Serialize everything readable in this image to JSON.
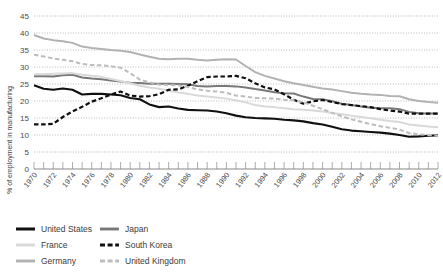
{
  "chart_data": {
    "type": "line",
    "title": "",
    "subtitle": "",
    "xlabel": "",
    "ylabel": "% of employment in manufacturing",
    "xlim": [
      1970,
      2012
    ],
    "ylim": [
      0,
      45
    ],
    "ytick_values": [
      0,
      5,
      10,
      15,
      20,
      25,
      30,
      35,
      40,
      45
    ],
    "ytick_labels": [
      "0",
      "5",
      "10",
      "15",
      "20",
      "25",
      "30",
      "35",
      "40",
      "45"
    ],
    "xtick_labels": [
      "1970",
      "1972",
      "1974",
      "1976",
      "1978",
      "1980",
      "1982",
      "1984",
      "1986",
      "1988",
      "1990",
      "1992",
      "1994",
      "1996",
      "1998",
      "2000",
      "2002",
      "2004",
      "2006",
      "2008",
      "2010",
      "2012"
    ],
    "x_minor_step": 1,
    "grid": "horizontal-dotted",
    "legend_position": "below-plot",
    "x": [
      1970,
      1971,
      1972,
      1973,
      1974,
      1975,
      1976,
      1977,
      1978,
      1979,
      1980,
      1981,
      1982,
      1983,
      1984,
      1985,
      1986,
      1987,
      1988,
      1989,
      1990,
      1991,
      1992,
      1993,
      1994,
      1995,
      1996,
      1997,
      1998,
      1999,
      2000,
      2001,
      2002,
      2003,
      2004,
      2005,
      2006,
      2007,
      2008,
      2009,
      2010,
      2011,
      2012
    ],
    "series": [
      {
        "name": "United States",
        "color": "#101010",
        "style": "solid",
        "width": 2.1,
        "values": [
          24.6,
          23.6,
          23.3,
          23.7,
          23.3,
          21.9,
          22.1,
          22.1,
          21.9,
          21.7,
          20.9,
          20.5,
          19.0,
          18.2,
          18.4,
          17.8,
          17.4,
          17.3,
          17.2,
          16.9,
          16.4,
          15.7,
          15.2,
          15.0,
          14.9,
          14.8,
          14.5,
          14.3,
          14.0,
          13.5,
          13.1,
          12.4,
          11.7,
          11.3,
          11.1,
          10.9,
          10.7,
          10.4,
          10.0,
          9.5,
          9.6,
          9.8,
          9.9
        ]
      },
      {
        "name": "Japan",
        "color": "#787878",
        "style": "solid",
        "width": 2.0,
        "values": [
          27.3,
          27.3,
          27.2,
          27.6,
          27.7,
          26.9,
          26.6,
          26.4,
          26.0,
          25.7,
          25.4,
          25.3,
          25.1,
          25.1,
          25.1,
          25.0,
          24.9,
          24.4,
          24.3,
          24.4,
          24.4,
          24.3,
          24.0,
          23.5,
          23.1,
          22.6,
          22.3,
          22.2,
          21.3,
          20.6,
          20.5,
          19.9,
          19.2,
          18.8,
          18.4,
          18.0,
          17.9,
          17.9,
          17.6,
          16.8,
          16.4,
          16.3,
          16.3
        ]
      },
      {
        "name": "France",
        "color": "#d9d9d9",
        "style": "solid",
        "width": 2.0,
        "values": [
          27.9,
          27.9,
          28.0,
          28.1,
          28.2,
          27.7,
          27.4,
          27.1,
          26.5,
          25.9,
          25.2,
          24.5,
          24.0,
          23.6,
          23.1,
          22.5,
          22.1,
          21.6,
          21.3,
          21.0,
          20.7,
          20.2,
          19.6,
          18.8,
          18.4,
          18.2,
          17.9,
          17.6,
          17.4,
          17.2,
          16.9,
          16.5,
          16.1,
          15.7,
          15.3,
          14.9,
          14.5,
          14.1,
          13.8,
          13.1,
          12.8,
          12.5,
          12.3
        ]
      },
      {
        "name": "South Korea",
        "color": "#101010",
        "style": "dashed",
        "width": 2.2,
        "values": [
          13.1,
          13.1,
          13.3,
          15.3,
          16.9,
          18.3,
          19.8,
          20.8,
          21.9,
          22.8,
          21.6,
          21.3,
          21.4,
          22.0,
          23.3,
          23.4,
          24.5,
          25.8,
          27.0,
          27.2,
          27.2,
          27.4,
          26.7,
          25.2,
          24.0,
          23.4,
          22.0,
          20.4,
          19.2,
          19.9,
          20.3,
          19.7,
          19.1,
          18.8,
          18.5,
          18.2,
          17.6,
          17.2,
          16.9,
          16.3,
          16.3,
          16.3,
          16.3
        ]
      },
      {
        "name": "Germany",
        "color": "#b2b2b2",
        "style": "solid",
        "width": 2.0,
        "values": [
          39.4,
          38.4,
          37.9,
          37.6,
          37.1,
          36.0,
          35.6,
          35.3,
          35.0,
          34.8,
          34.4,
          33.7,
          33.0,
          32.4,
          32.3,
          32.4,
          32.4,
          32.1,
          31.9,
          32.1,
          32.3,
          32.2,
          30.3,
          28.5,
          27.4,
          26.6,
          25.8,
          25.2,
          24.7,
          24.2,
          23.7,
          23.4,
          22.9,
          22.4,
          22.1,
          21.9,
          21.8,
          21.5,
          21.4,
          20.5,
          20.0,
          19.7,
          19.5
        ]
      },
      {
        "name": "United Kingdom",
        "color": "#bdbdbd",
        "style": "dashed",
        "width": 2.0,
        "values": [
          33.6,
          33.1,
          32.5,
          32.1,
          31.7,
          30.9,
          30.6,
          30.5,
          30.2,
          29.8,
          28.2,
          26.3,
          25.5,
          24.8,
          24.7,
          24.6,
          24.1,
          23.4,
          23.0,
          22.8,
          22.4,
          21.6,
          21.3,
          20.9,
          20.8,
          20.7,
          20.4,
          20.2,
          19.6,
          18.6,
          17.6,
          16.5,
          15.5,
          14.6,
          13.9,
          13.2,
          12.6,
          12.1,
          11.6,
          10.6,
          10.2,
          10.0,
          9.8
        ]
      }
    ]
  },
  "legend": {
    "items": [
      {
        "label": "United States",
        "key": "united-states"
      },
      {
        "label": "Japan",
        "key": "japan"
      },
      {
        "label": "France",
        "key": "france"
      },
      {
        "label": "South Korea",
        "key": "south-korea"
      },
      {
        "label": "Germany",
        "key": "germany"
      },
      {
        "label": "United Kingdom",
        "key": "united-kingdom"
      }
    ]
  }
}
